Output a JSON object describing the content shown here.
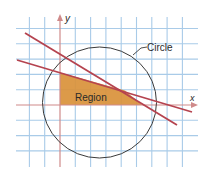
{
  "figure": {
    "labels": {
      "y_axis": "y",
      "x_axis": "x",
      "circle": "Circle",
      "region": "Region"
    },
    "colors": {
      "grid": "#a9cbe8",
      "axis": "#cf8a8a",
      "line": "#b5434f",
      "region_fill": "#d9913a",
      "circle": "#3a3a3a",
      "text": "#2a2a2a"
    },
    "elements": [
      {
        "type": "grid",
        "spacing": "1 unit"
      },
      {
        "type": "axes",
        "names": [
          "x",
          "y"
        ]
      },
      {
        "type": "circle",
        "label": "Circle"
      },
      {
        "type": "line",
        "name": "steep-line"
      },
      {
        "type": "line",
        "name": "shallow-line"
      },
      {
        "type": "shaded-region",
        "label": "Region",
        "shape": "triangle bounded by y-axis, x-axis and line"
      }
    ]
  }
}
